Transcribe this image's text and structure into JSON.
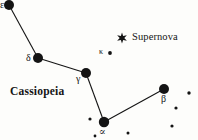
{
  "figure": {
    "kind": "star-chart",
    "background_color": "#fdfdfb",
    "ink_color": "#141414",
    "width": 198,
    "height": 140
  },
  "constellation": {
    "name": "Cassiopeia",
    "name_x": 10,
    "name_y": 86
  },
  "event": {
    "marker_name": "supernova-star-icon",
    "label": "Supernova",
    "marker_x": 122,
    "marker_y": 38,
    "label_x": 132,
    "label_y": 32
  },
  "bright_stars": [
    {
      "id": "epsilon",
      "label": "ε",
      "x": 9,
      "y": 5,
      "r": 5.0,
      "label_x": 0,
      "label_y": 0,
      "label_visible": true
    },
    {
      "id": "delta",
      "label": "δ",
      "x": 38,
      "y": 58,
      "r": 5.0,
      "label_x": 26,
      "label_y": 53,
      "label_visible": true
    },
    {
      "id": "gamma",
      "label": "γ",
      "x": 86,
      "y": 73,
      "r": 5.0,
      "label_x": 76,
      "label_y": 74,
      "label_visible": true
    },
    {
      "id": "alpha",
      "label": "∝",
      "x": 104,
      "y": 122,
      "r": 5.2,
      "label_x": 99,
      "label_y": 127,
      "label_visible": true
    },
    {
      "id": "beta",
      "label": "β",
      "x": 164,
      "y": 89,
      "r": 5.0,
      "label_x": 161,
      "label_y": 94,
      "label_visible": true
    }
  ],
  "constellation_lines": [
    {
      "from": "epsilon",
      "to": "delta"
    },
    {
      "from": "delta",
      "to": "gamma"
    },
    {
      "from": "gamma",
      "to": "alpha"
    },
    {
      "from": "alpha",
      "to": "beta"
    }
  ],
  "faint_stars": [
    {
      "id": "kappa",
      "label": "κ",
      "x": 110,
      "y": 53,
      "r": 1.9,
      "label_x": 99,
      "label_y": 48,
      "label_visible": true
    },
    {
      "id": "f1",
      "label": "",
      "x": 90,
      "y": 119,
      "r": 1.6,
      "label_visible": false
    },
    {
      "id": "f2",
      "label": "",
      "x": 189,
      "y": 93,
      "r": 1.7,
      "label_visible": false
    },
    {
      "id": "f3",
      "label": "",
      "x": 176,
      "y": 108,
      "r": 1.6,
      "label_visible": false
    },
    {
      "id": "f4",
      "label": "",
      "x": 172,
      "y": 126,
      "r": 1.6,
      "label_visible": false
    },
    {
      "id": "f5",
      "label": "",
      "x": 128,
      "y": 133,
      "r": 1.5,
      "label_visible": false
    },
    {
      "id": "f6",
      "label": "",
      "x": 95,
      "y": 136,
      "r": 1.4,
      "label_visible": false
    }
  ],
  "chart_data": {
    "type": "scatter",
    "title": "Cassiopeia",
    "xlabel": "",
    "ylabel": "",
    "xlim": [
      0,
      198
    ],
    "ylim": [
      0,
      140
    ],
    "grid": false,
    "legend": "none",
    "annotations": [
      "Cassiopeia",
      "Supernova",
      "ε",
      "δ",
      "γ",
      "∝",
      "β",
      "κ"
    ],
    "series": [
      {
        "name": "bright stars",
        "marker": "filled-circle",
        "x": [
          9,
          38,
          86,
          104,
          164
        ],
        "y": [
          5,
          58,
          73,
          122,
          89
        ],
        "labels": [
          "ε",
          "δ",
          "γ",
          "∝",
          "β"
        ]
      },
      {
        "name": "faint stars",
        "marker": "small-dot",
        "x": [
          110,
          90,
          189,
          176,
          172,
          128,
          95
        ],
        "y": [
          53,
          119,
          93,
          108,
          126,
          133,
          136
        ],
        "labels": [
          "κ",
          "",
          "",
          "",
          "",
          "",
          ""
        ]
      },
      {
        "name": "supernova",
        "marker": "star-burst",
        "x": [
          122
        ],
        "y": [
          38
        ],
        "labels": [
          "Supernova"
        ]
      }
    ]
  }
}
